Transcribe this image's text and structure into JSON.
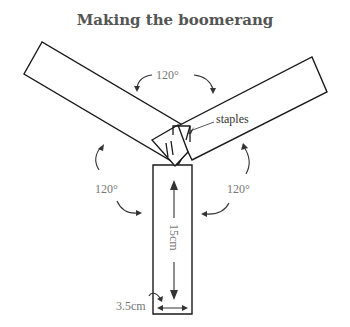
{
  "title": "Making the boomerang",
  "labels": {
    "angle_top": "120°",
    "angle_left": "120°",
    "angle_right": "120°",
    "staples": "staples",
    "length": "15cm",
    "width": "3.5cm"
  },
  "colors": {
    "line": "#1a1a1a",
    "label": "#777777",
    "title": "#555555"
  }
}
